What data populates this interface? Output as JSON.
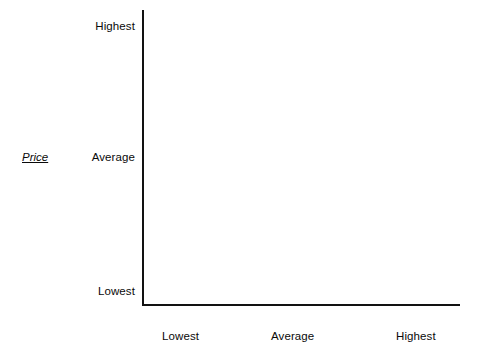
{
  "chart_data": {
    "type": "scatter",
    "title": "",
    "subtitle": "",
    "xlabel": "",
    "ylabel": "Price",
    "x": [],
    "values": [],
    "series": [],
    "annotations": [],
    "grid": false,
    "legend_position": "none",
    "x_tick_labels": [
      "Lowest",
      "Average",
      "Highest"
    ],
    "y_tick_labels": [
      "Lowest",
      "Average",
      "Highest"
    ],
    "xlim": [
      "Lowest",
      "Highest"
    ],
    "ylim": [
      "Lowest",
      "Highest"
    ],
    "note": "Empty two-axis positioning grid; no data points plotted."
  },
  "axes": {
    "y": {
      "title": "Price",
      "ticks": {
        "highest": "Highest",
        "average": "Average",
        "lowest": "Lowest"
      }
    },
    "x": {
      "title": "",
      "ticks": {
        "lowest": "Lowest",
        "average": "Average",
        "highest": "Highest"
      }
    }
  },
  "colors": {
    "axis": "#121212",
    "text": "#0a0a0a",
    "background": "#ffffff"
  }
}
